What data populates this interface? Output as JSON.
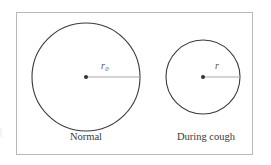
{
  "figure": {
    "background_color": "#ffffff",
    "frame_color": "#b9b9b9",
    "circle_stroke_color": "#3a3a3a",
    "radius_line_color": "#a8a8a8",
    "center_dot_color": "#333333",
    "label_color": "#555555",
    "caption_color": "#3a3a3a",
    "page_edge_artifact": "|"
  },
  "panels": [
    {
      "id": "normal",
      "caption": "Normal",
      "radius_label": "r",
      "radius_subscript": "0",
      "circle": {
        "cx": 86,
        "cy": 77,
        "r": 54
      },
      "center_dot": {
        "cx": 86,
        "cy": 77,
        "r": 2
      },
      "radius_line": {
        "x1": 86,
        "y1": 77,
        "x2": 140,
        "y2": 77
      }
    },
    {
      "id": "during-cough",
      "caption": "During cough",
      "radius_label": "r",
      "radius_subscript": "",
      "circle": {
        "cx": 203,
        "cy": 77,
        "r": 37
      },
      "center_dot": {
        "cx": 203,
        "cy": 77,
        "r": 2
      },
      "radius_line": {
        "x1": 203,
        "y1": 77,
        "x2": 240,
        "y2": 77
      }
    }
  ]
}
